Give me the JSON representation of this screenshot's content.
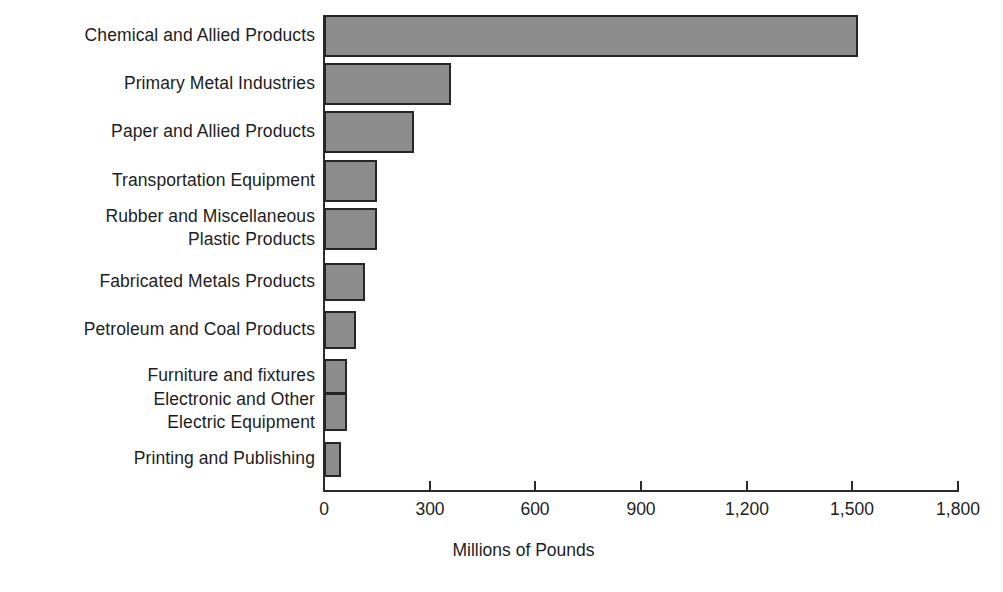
{
  "chart_data": {
    "type": "bar",
    "orientation": "horizontal",
    "title": "",
    "xlabel": "Millions of Pounds",
    "ylabel": "",
    "xlim": [
      0,
      1800
    ],
    "xticks": [
      0,
      300,
      600,
      900,
      1200,
      1500,
      1800
    ],
    "xtick_labels": [
      "0",
      "300",
      "600",
      "900",
      "1,200",
      "1,500",
      "1,800"
    ],
    "grid": false,
    "legend": null,
    "bar_fill_color": "#8c8c8c",
    "bar_edge_color": "#262626",
    "axis_color": "#2b2b2b",
    "categories": [
      "Chemical and Allied Products",
      "Primary Metal Industries",
      "Paper and Allied Products",
      "Transportation Equipment",
      "Rubber and Miscellaneous\nPlastic Products",
      "Fabricated Metals Products",
      "Petroleum and Coal Products",
      "Furniture and fixtures",
      "Electronic and Other\nElectric Equipment",
      "Printing and Publishing"
    ],
    "values": [
      1515,
      360,
      255,
      150,
      150,
      115,
      92,
      65,
      65,
      48
    ]
  }
}
